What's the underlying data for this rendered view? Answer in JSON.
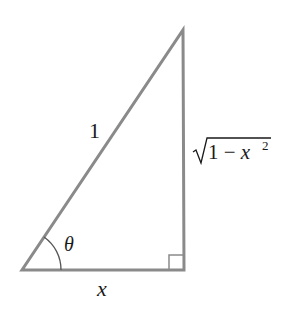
{
  "diagram": {
    "type": "right-triangle",
    "stroke_color": "#8a8a8a",
    "text_color": "#1a1a1a",
    "labels": {
      "hypotenuse": "1",
      "adjacent": "x",
      "opposite_radical": "1 − x",
      "opposite_exponent": "2",
      "angle": "θ"
    },
    "marks": {
      "right_angle": "bottom-right",
      "angle_arc": "bottom-left"
    }
  }
}
